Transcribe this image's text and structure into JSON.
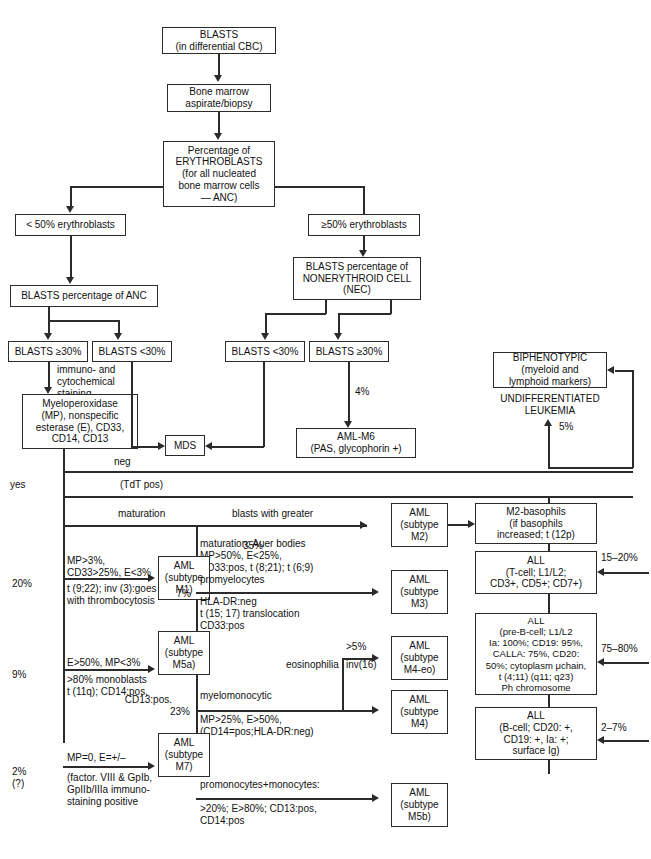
{
  "diagram": {
    "nodes": {
      "blasts": "BLASTS\n(in differential CBC)",
      "bone_marrow": "Bone marrow\naspirate/biopsy",
      "erythroblast_pct": "Percentage of\nERYTHROBLASTS\n(for all nucleated\nbone marrow cells\n— ANC)",
      "lt50_eryth": "< 50% erythroblasts",
      "ge50_eryth": "≥50% erythroblasts",
      "blasts_pct_anc": "BLASTS percentage of ANC",
      "blasts_pct_nec": "BLASTS percentage of\nNONERYTHROID CELL\n(NEC)",
      "anc_ge30": "BLASTS ≥30%",
      "anc_lt30": "BLASTS <30%",
      "nec_lt30": "BLASTS <30%",
      "nec_ge30": "BLASTS ≥30%",
      "mpo_panel": "Myeloperoxidase\n(MP), nonspecific\nesterase (E), CD33,\nCD14, CD13",
      "mds": "MDS",
      "aml_m6": "AML-M6\n(PAS, glycophorin +)",
      "biphenotypic": "BIPHENOTYPIC\n(myeloid and\nlymphoid markers)",
      "undifferentiated": "UNDIFFERENTIATED\nLEUKEMIA",
      "aml_m1": "AML\n(subtype\nM1)",
      "aml_m2": "AML\n(subtype\nM2)",
      "aml_m3": "AML\n(subtype\nM3)",
      "aml_m4eo": "AML\n(subtype\nM4-eo)",
      "aml_m4": "AML\n(subtype\nM4)",
      "aml_m5a": "AML\n(subtype\nM5a)",
      "aml_m5b": "AML\n(subtype\nM5b)",
      "aml_m7": "AML\n(subtype\nM7)",
      "m2_basophils": "M2-basophils\n(if basophils\nincreased; t (12p)",
      "all_tcell": "ALL\n(T-cell; L1/L2;\nCD3+, CD5+; CD7+)",
      "all_prebcell": "ALL\n(pre-B-cell; L1/L2\nIa: 100%; CD19: 95%,\nCALLA: 75%, CD20:\n50%; cytoplasm μchain,\nt (4;11) (q11; q23)\nPh chromosome",
      "all_bcell": "ALL\n(B-cell; CD20: +,\nCD19: +, Ia: +;\nsurface Ig)"
    },
    "edge_labels": {
      "immuno_cytochem": "immuno- and\ncytochemical\nstaining",
      "pct_4": "4%",
      "pct_5": "5%",
      "neg": "neg",
      "tdt_pos": "(TdT pos)",
      "yes": "yes",
      "maturation": "maturation",
      "blasts_with_greater": "blasts with greater",
      "pct_35": "35%",
      "pct_20": "20%",
      "pct_7": "7%",
      "pct_9": "9%",
      "pct_2": "2%",
      "pct_2_q": "(?)",
      "pct_23": "23%",
      "pct_gt5": ">5%",
      "inv16": "inv(16)",
      "eosinophilia": "eosinophilia",
      "promyelocytes": "promyelocytes",
      "myelomonocytic": "myelomonocytic",
      "promonocytes": "promonocytes+monocytes:",
      "pct_15_20": "15–20%",
      "pct_75_80": "75–80%",
      "pct_2_7": "2–7%"
    },
    "criteria": {
      "m1_top": "MP>3%,\nCD33>25%, E<3%",
      "m1_bottom": "t (9;22); inv (3):goes\nwith thrombocytosis",
      "m2_detail": "maturation; Auer bodies\nMP>50%, E<25%,\nCD33:pos, t (8;21); t (6;9)",
      "m3_detail": "HLA-DR:neg\nt (15; 17) translocation\nCD33:pos",
      "m4_detail": "MP>25%, E>50%,\n(CD14=pos;HLA-DR:neg)",
      "m5a_top": "E>50%, MP<3%",
      "m5a_bottom": ">80% monoblasts\nt (11q); CD14:pos,",
      "m5a_bottom2": "CD13:pos.",
      "m5b_detail": ">20%; E>80%; CD13:pos,\nCD14:pos",
      "m7_top": "MP=0, E=+/–",
      "m7_bottom": "(factor. VIII & GpIb,\nGpIIb/IIIa immuno-\nstaining positive"
    },
    "colors": {
      "line": "#2b2b2b",
      "background": "#ffffff",
      "text": "#111111"
    }
  }
}
